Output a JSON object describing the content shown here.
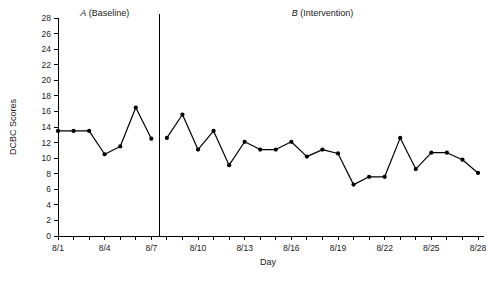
{
  "chart_data": {
    "type": "line",
    "title": "",
    "xlabel": "Day",
    "ylabel": "DCBC Scores",
    "ylim": [
      0,
      28
    ],
    "ytick_step": 2,
    "yticks": [
      0,
      2,
      4,
      6,
      8,
      10,
      12,
      14,
      16,
      18,
      20,
      22,
      24,
      26,
      28
    ],
    "grid": false,
    "legend": "none",
    "marker": "filled-circle",
    "line_color": "#000000",
    "x": [
      "8/1",
      "8/2",
      "8/3",
      "8/4",
      "8/5",
      "8/6",
      "8/7",
      "8/8",
      "8/9",
      "8/10",
      "8/11",
      "8/12",
      "8/13",
      "8/14",
      "8/15",
      "8/16",
      "8/17",
      "8/18",
      "8/19",
      "8/20",
      "8/21",
      "8/22",
      "8/23",
      "8/24",
      "8/25",
      "8/26",
      "8/27",
      "8/28"
    ],
    "xtick_labels_shown": [
      "8/1",
      "8/4",
      "8/7",
      "8/10",
      "8/13",
      "8/16",
      "8/19",
      "8/22",
      "8/25",
      "8/28"
    ],
    "values": [
      13.5,
      13.5,
      13.5,
      10.5,
      11.5,
      16.5,
      12.5,
      12.6,
      15.6,
      11.1,
      13.5,
      9.1,
      12.1,
      11.1,
      11.1,
      12.1,
      10.2,
      11.1,
      10.6,
      6.6,
      7.6,
      7.6,
      12.6,
      8.6,
      10.7,
      10.7,
      9.8,
      8.1
    ],
    "phases": [
      {
        "id": "A",
        "letter": "A",
        "name": "(Baseline)",
        "start_x": "8/1",
        "end_x": "8/7"
      },
      {
        "id": "B",
        "letter": "B",
        "name": "(Intervention)",
        "start_x": "8/8",
        "end_x": "8/28"
      }
    ],
    "phase_divider_after": "8/7"
  },
  "axis": {
    "y_title": "DCBC Scores",
    "x_title": "Day"
  }
}
